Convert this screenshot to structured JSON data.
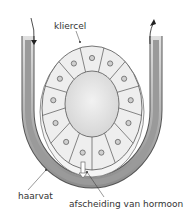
{
  "diagram": {
    "labels": {
      "cell": "kliercel",
      "capillary": "haarvat",
      "secretion": "afscheiding van hormoon"
    },
    "colors": {
      "wall_gray": "#9a9a9a",
      "cell_fill": "#eeeeee",
      "lumen_fill": "#e2e2e2",
      "outline": "#555555"
    },
    "arrows": {
      "left": "in",
      "right": "out"
    }
  }
}
